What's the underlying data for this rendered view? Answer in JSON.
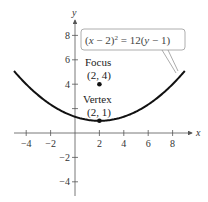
{
  "figure": {
    "equation": "(x − 2)² = 12(y − 1)",
    "equation_parts": {
      "a": "(",
      "x": "x",
      "b": " − 2)",
      "exp": "2",
      "c": " = 12(",
      "y": "y",
      "d": " − 1)"
    },
    "x_axis_label": "x",
    "y_axis_label": "y",
    "x_ticks": [
      {
        "value": -4,
        "label": "−4"
      },
      {
        "value": -2,
        "label": "−2"
      },
      {
        "value": 2,
        "label": "2"
      },
      {
        "value": 4,
        "label": "4"
      },
      {
        "value": 6,
        "label": "6"
      },
      {
        "value": 8,
        "label": "8"
      }
    ],
    "y_ticks": [
      {
        "value": 8,
        "label": "8"
      },
      {
        "value": 6,
        "label": "6"
      },
      {
        "value": 4,
        "label": "4"
      },
      {
        "value": 2,
        "label": ""
      },
      {
        "value": -2,
        "label": "−2"
      },
      {
        "value": -4,
        "label": "−4"
      }
    ],
    "focus": {
      "title": "Focus",
      "coords": "(2, 4)",
      "x": 2,
      "y": 4
    },
    "vertex": {
      "title": "Vertex",
      "coords": "(2, 1)",
      "x": 2,
      "y": 1
    },
    "curve": {
      "x_min": -5,
      "x_max": 9,
      "h": 2,
      "k": 1,
      "p4": 12
    },
    "colors": {
      "curve": "#111111",
      "axis": "#555555",
      "callout": "#888888"
    }
  }
}
